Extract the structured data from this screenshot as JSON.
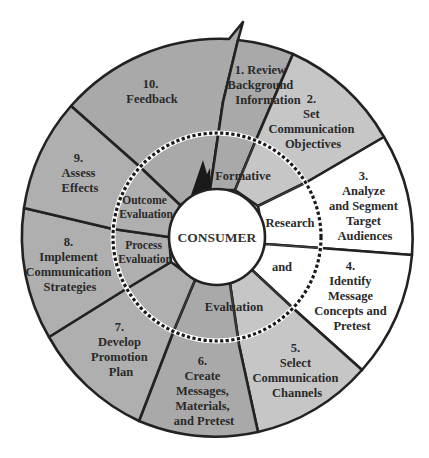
{
  "diagram": {
    "center": {
      "label": "CONSUMER"
    },
    "colors": {
      "dark_gray": "#a9a9a9",
      "mid_gray": "#afafaf",
      "light_gray": "#c6c6c6",
      "white": "#ffffff",
      "line": "#222222",
      "black_arrow": "#1a1a1a"
    },
    "steps": [
      {
        "id": 1,
        "lines": [
          "1. Review",
          "Background",
          "Information"
        ]
      },
      {
        "id": 2,
        "lines": [
          "2.",
          "Set",
          "Communication",
          "Objectives"
        ]
      },
      {
        "id": 3,
        "lines": [
          "3.",
          "Analyze",
          "and Segment",
          "Target",
          "Audiences"
        ]
      },
      {
        "id": 4,
        "lines": [
          "4.",
          "Identify",
          "Message",
          "Concepts and",
          "Pretest"
        ]
      },
      {
        "id": 5,
        "lines": [
          "5.",
          "Select",
          "Communication",
          "Channels"
        ]
      },
      {
        "id": 6,
        "lines": [
          "6.",
          "Create",
          "Messages,",
          "Materials,",
          "and Pretest"
        ]
      },
      {
        "id": 7,
        "lines": [
          "7.",
          "Develop",
          "Promotion",
          "Plan"
        ]
      },
      {
        "id": 8,
        "lines": [
          "8.",
          "Implement",
          "Communication",
          "Strategies"
        ]
      },
      {
        "id": 9,
        "lines": [
          "9.",
          "Assess",
          "Effects"
        ]
      },
      {
        "id": 10,
        "lines": [
          "10.",
          "Feedback"
        ]
      }
    ],
    "inner_ring": {
      "formative": "Formative",
      "research": "Research",
      "and": "and",
      "evaluation": "Evaluation",
      "process_evaluation": [
        "Process",
        "Evaluation"
      ],
      "outcome_evaluation": [
        "Outcome",
        "Evaluation"
      ]
    }
  }
}
